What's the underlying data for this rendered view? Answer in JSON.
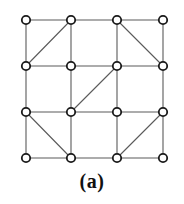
{
  "figure": {
    "caption": "(a)",
    "colors": {
      "background": "#ffffff",
      "edge": "#5a5a5a",
      "node_stroke": "#1a1a1a",
      "node_fill": "#ffffff",
      "caption_text": "#111111"
    },
    "style": {
      "edge_width": 1.1,
      "node_radius": 4.2,
      "node_stroke_width": 1.8
    }
  },
  "chart_data": {
    "type": "diagram",
    "title": "(a)",
    "grid": {
      "rows": 4,
      "cols": 4
    },
    "nodes": [
      {
        "id": "n00",
        "row": 0,
        "col": 0,
        "x": 26,
        "y": 20
      },
      {
        "id": "n01",
        "row": 0,
        "col": 1,
        "x": 71,
        "y": 20
      },
      {
        "id": "n02",
        "row": 0,
        "col": 2,
        "x": 117,
        "y": 20
      },
      {
        "id": "n03",
        "row": 0,
        "col": 3,
        "x": 163,
        "y": 20
      },
      {
        "id": "n10",
        "row": 1,
        "col": 0,
        "x": 26,
        "y": 66
      },
      {
        "id": "n11",
        "row": 1,
        "col": 1,
        "x": 71,
        "y": 66
      },
      {
        "id": "n12",
        "row": 1,
        "col": 2,
        "x": 117,
        "y": 66
      },
      {
        "id": "n13",
        "row": 1,
        "col": 3,
        "x": 163,
        "y": 66
      },
      {
        "id": "n20",
        "row": 2,
        "col": 0,
        "x": 26,
        "y": 112
      },
      {
        "id": "n21",
        "row": 2,
        "col": 1,
        "x": 71,
        "y": 112
      },
      {
        "id": "n22",
        "row": 2,
        "col": 2,
        "x": 117,
        "y": 112
      },
      {
        "id": "n23",
        "row": 2,
        "col": 3,
        "x": 163,
        "y": 112
      },
      {
        "id": "n30",
        "row": 3,
        "col": 0,
        "x": 26,
        "y": 158
      },
      {
        "id": "n31",
        "row": 3,
        "col": 1,
        "x": 71,
        "y": 158
      },
      {
        "id": "n32",
        "row": 3,
        "col": 2,
        "x": 117,
        "y": 158
      },
      {
        "id": "n33",
        "row": 3,
        "col": 3,
        "x": 163,
        "y": 158
      }
    ],
    "edges": [
      {
        "from": "n00",
        "to": "n01",
        "kind": "horizontal"
      },
      {
        "from": "n01",
        "to": "n02",
        "kind": "horizontal"
      },
      {
        "from": "n02",
        "to": "n03",
        "kind": "horizontal"
      },
      {
        "from": "n10",
        "to": "n11",
        "kind": "horizontal"
      },
      {
        "from": "n11",
        "to": "n12",
        "kind": "horizontal"
      },
      {
        "from": "n12",
        "to": "n13",
        "kind": "horizontal"
      },
      {
        "from": "n20",
        "to": "n21",
        "kind": "horizontal"
      },
      {
        "from": "n21",
        "to": "n22",
        "kind": "horizontal"
      },
      {
        "from": "n22",
        "to": "n23",
        "kind": "horizontal"
      },
      {
        "from": "n30",
        "to": "n31",
        "kind": "horizontal"
      },
      {
        "from": "n31",
        "to": "n32",
        "kind": "horizontal"
      },
      {
        "from": "n32",
        "to": "n33",
        "kind": "horizontal"
      },
      {
        "from": "n00",
        "to": "n10",
        "kind": "vertical"
      },
      {
        "from": "n10",
        "to": "n20",
        "kind": "vertical"
      },
      {
        "from": "n20",
        "to": "n30",
        "kind": "vertical"
      },
      {
        "from": "n01",
        "to": "n11",
        "kind": "vertical"
      },
      {
        "from": "n11",
        "to": "n21",
        "kind": "vertical"
      },
      {
        "from": "n21",
        "to": "n31",
        "kind": "vertical"
      },
      {
        "from": "n02",
        "to": "n12",
        "kind": "vertical"
      },
      {
        "from": "n12",
        "to": "n22",
        "kind": "vertical"
      },
      {
        "from": "n22",
        "to": "n32",
        "kind": "vertical"
      },
      {
        "from": "n03",
        "to": "n13",
        "kind": "vertical"
      },
      {
        "from": "n13",
        "to": "n23",
        "kind": "vertical"
      },
      {
        "from": "n23",
        "to": "n33",
        "kind": "vertical"
      },
      {
        "from": "n10",
        "to": "n01",
        "kind": "diagonal"
      },
      {
        "from": "n02",
        "to": "n13",
        "kind": "diagonal"
      },
      {
        "from": "n21",
        "to": "n12",
        "kind": "diagonal"
      },
      {
        "from": "n20",
        "to": "n31",
        "kind": "diagonal"
      },
      {
        "from": "n32",
        "to": "n23",
        "kind": "diagonal"
      }
    ]
  }
}
